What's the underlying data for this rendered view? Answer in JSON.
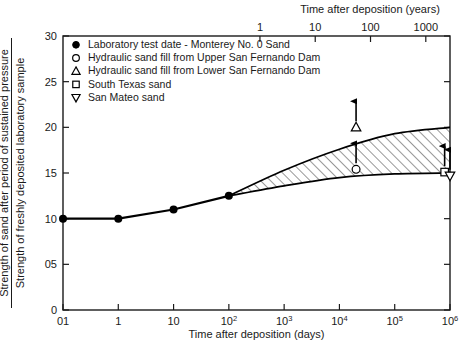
{
  "chart_data": {
    "type": "line",
    "title": "",
    "xlabel": "Time after deposition (days)",
    "ylabel_numerator": "Strength of sand after period of sustained pressure",
    "ylabel_denominator": "Strength of freshly deposited laboratory sample",
    "xlabel_top": "Time after deposition (years)",
    "xscale": "log",
    "xlim": [
      0.1,
      1000000
    ],
    "ylim": [
      0,
      30
    ],
    "grid": false,
    "legend_position": "upper-left-inside",
    "xticks": [
      {
        "value": 0.1,
        "label": "01",
        "sup": ""
      },
      {
        "value": 1,
        "label": "1",
        "sup": ""
      },
      {
        "value": 10,
        "label": "10",
        "sup": ""
      },
      {
        "value": 100,
        "label": "10",
        "sup": "2"
      },
      {
        "value": 1000,
        "label": "10",
        "sup": "3"
      },
      {
        "value": 10000,
        "label": "10",
        "sup": "4"
      },
      {
        "value": 100000,
        "label": "10",
        "sup": "5"
      },
      {
        "value": 1000000,
        "label": "10",
        "sup": "6"
      }
    ],
    "yticks": [
      {
        "value": 0,
        "label": "0"
      },
      {
        "value": 5,
        "label": "05"
      },
      {
        "value": 10,
        "label": "10"
      },
      {
        "value": 15,
        "label": "15"
      },
      {
        "value": 20,
        "label": "20"
      },
      {
        "value": 25,
        "label": "25"
      },
      {
        "value": 30,
        "label": "30"
      }
    ],
    "xticks_top": [
      {
        "value_days": 365,
        "label": "1"
      },
      {
        "value_days": 3650,
        "label": "10"
      },
      {
        "value_days": 36500,
        "label": "100"
      },
      {
        "value_days": 365000,
        "label": "1000"
      }
    ],
    "series": [
      {
        "name": "Laboratory test data - Monterey No. 0 Sand",
        "marker": "filled-circle",
        "style": "line-with-markers",
        "points": [
          {
            "x": 0.1,
            "y": 10.0
          },
          {
            "x": 1,
            "y": 10.0
          },
          {
            "x": 10,
            "y": 11.0
          },
          {
            "x": 100,
            "y": 12.5
          }
        ]
      },
      {
        "name": "Upper bound of hatched band",
        "marker": "none",
        "style": "band-upper",
        "points": [
          {
            "x": 100,
            "y": 12.5
          },
          {
            "x": 1000,
            "y": 15.3
          },
          {
            "x": 10000,
            "y": 17.6
          },
          {
            "x": 100000,
            "y": 19.3
          },
          {
            "x": 1000000,
            "y": 20.0
          }
        ]
      },
      {
        "name": "Lower bound of hatched band",
        "marker": "none",
        "style": "band-lower",
        "points": [
          {
            "x": 100,
            "y": 12.5
          },
          {
            "x": 1000,
            "y": 13.6
          },
          {
            "x": 10000,
            "y": 14.5
          },
          {
            "x": 100000,
            "y": 14.9
          },
          {
            "x": 1000000,
            "y": 15.0
          }
        ]
      }
    ],
    "field_points": [
      {
        "name": "Lower San Fernando Dam",
        "marker": "triangle-up",
        "x": 20000,
        "y": 20.0,
        "arrow": "up"
      },
      {
        "name": "Upper San Fernando Dam",
        "marker": "open-circle",
        "x": 20000,
        "y": 15.4,
        "arrow": "up"
      },
      {
        "name": "South Texas sand",
        "marker": "open-square",
        "x": 800000,
        "y": 15.1,
        "arrow": "up"
      },
      {
        "name": "San Mateo sand",
        "marker": "triangle-down",
        "x": 1000000,
        "y": 14.7,
        "arrow": "up"
      }
    ],
    "legend": [
      {
        "marker": "filled-circle",
        "label": "Laboratory test date - Monterey No. 0 Sand"
      },
      {
        "marker": "open-circle",
        "label": "Hydraulic sand fill from Upper San Fernando Dam"
      },
      {
        "marker": "triangle-up",
        "label": "Hydraulic sand fill from Lower San Fernando Dam"
      },
      {
        "marker": "open-square",
        "label": "South Texas sand"
      },
      {
        "marker": "triangle-down",
        "label": "San Mateo sand"
      }
    ],
    "colors": {
      "line": "#000000",
      "frame": "#1a1a1a",
      "hatch": "#1a1a1a",
      "background": "#ffffff"
    }
  }
}
